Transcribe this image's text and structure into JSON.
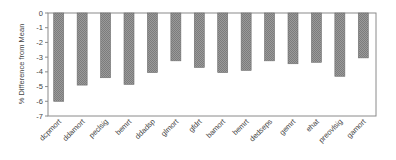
{
  "chart_data": {
    "type": "bar",
    "title": "",
    "xlabel": "",
    "ylabel": "% Difference from Mean",
    "ylim": [
      -7,
      0
    ],
    "yticks": [
      0,
      -1,
      -2,
      -3,
      -4,
      -5,
      -6,
      -7
    ],
    "grid": false,
    "legend": null,
    "categories": [
      "dcpmort",
      "ddamort",
      "peclsig",
      "bemrt",
      "ddadsp",
      "glmort",
      "gfdrt",
      "bamort",
      "bemrt",
      "dedseps",
      "gemrt",
      "ehat",
      "preovlsig",
      "gamort"
    ],
    "values": [
      -6.0,
      -4.9,
      -4.4,
      -4.85,
      -4.05,
      -3.25,
      -3.7,
      -4.05,
      -3.9,
      -3.25,
      -3.45,
      -3.35,
      -4.3,
      -3.05
    ],
    "colors": {
      "bar_fill": "#8c8c8c",
      "bar_stroke": "#6e6e6e",
      "axis": "#8a8a8a",
      "text": "#444444"
    }
  }
}
